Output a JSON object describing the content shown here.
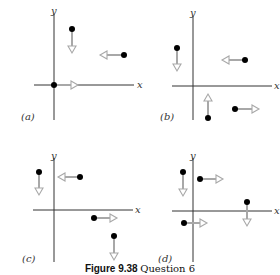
{
  "figure": {
    "caption_number": "Figure 9.38",
    "caption_text": "Question 6",
    "axis_x_label": "x",
    "axis_y_label": "y",
    "colors": {
      "dot": "#000000",
      "arrow": "#a8a8a8",
      "axis": "#333333"
    }
  },
  "panels": [
    {
      "label": "(a)",
      "origin": [
        54,
        85
      ],
      "vectors": [
        {
          "point": [
            72,
            29
          ],
          "direction": "down",
          "end": [
            72,
            52
          ]
        },
        {
          "point": [
            124,
            55
          ],
          "direction": "left",
          "end": [
            100,
            55
          ]
        },
        {
          "point": [
            54,
            85
          ],
          "direction": "right",
          "end": [
            78,
            85
          ]
        }
      ]
    },
    {
      "label": "(b)",
      "origin": [
        193,
        86
      ],
      "vectors": [
        {
          "point": [
            177,
            48
          ],
          "direction": "down",
          "end": [
            177,
            70
          ]
        },
        {
          "point": [
            245,
            60
          ],
          "direction": "left",
          "end": [
            222,
            60
          ]
        },
        {
          "point": [
            208,
            118
          ],
          "direction": "up",
          "end": [
            208,
            94
          ]
        },
        {
          "point": [
            235,
            109
          ],
          "direction": "right",
          "end": [
            259,
            109
          ]
        }
      ]
    },
    {
      "label": "(c)",
      "origin": [
        54,
        210
      ],
      "vectors": [
        {
          "point": [
            39,
            172
          ],
          "direction": "down",
          "end": [
            39,
            195
          ]
        },
        {
          "point": [
            80,
            177
          ],
          "direction": "left",
          "end": [
            58,
            177
          ]
        },
        {
          "point": [
            94,
            218
          ],
          "direction": "right",
          "end": [
            117,
            218
          ]
        },
        {
          "point": [
            114,
            236
          ],
          "direction": "down",
          "end": [
            114,
            260
          ]
        }
      ]
    },
    {
      "label": "(d)",
      "origin": [
        193,
        211
      ],
      "vectors": [
        {
          "point": [
            183,
            172
          ],
          "direction": "down",
          "end": [
            183,
            196
          ]
        },
        {
          "point": [
            200,
            179
          ],
          "direction": "right",
          "end": [
            223,
            179
          ]
        },
        {
          "point": [
            247,
            202
          ],
          "direction": "down",
          "end": [
            247,
            226
          ]
        },
        {
          "point": [
            184,
            223
          ],
          "direction": "right",
          "end": [
            207,
            223
          ]
        }
      ]
    }
  ]
}
